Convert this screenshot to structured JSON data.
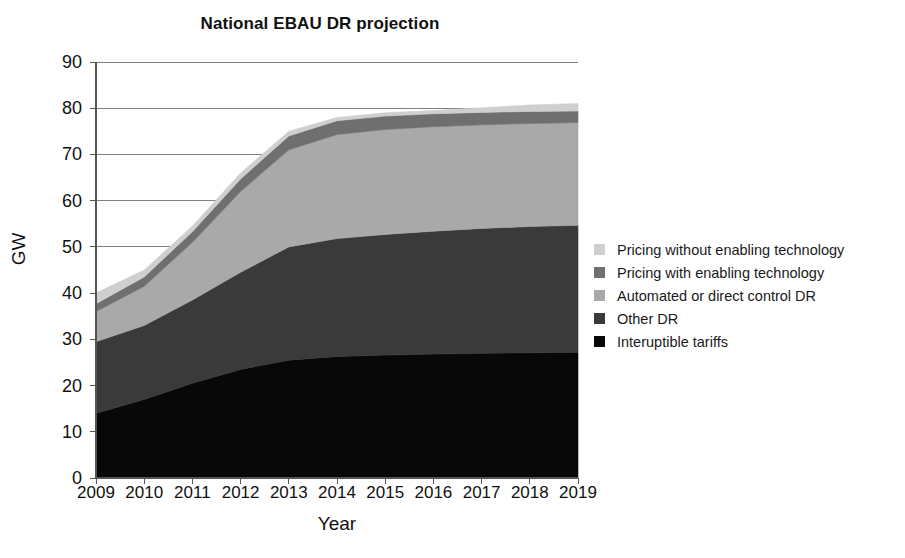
{
  "chart_data": {
    "type": "area",
    "title": "National EBAU DR projection",
    "xlabel": "Year",
    "ylabel": "GW",
    "stacked": true,
    "grid": true,
    "legend_position": "right",
    "categories": [
      2009,
      2010,
      2011,
      2012,
      2013,
      2014,
      2015,
      2016,
      2017,
      2018,
      2019
    ],
    "xtick_labels": [
      "2009",
      "2010",
      "2011",
      "2012",
      "2013",
      "2014",
      "2015",
      "2016",
      "2017",
      "2018",
      "2019"
    ],
    "ytick_labels": [
      "0",
      "10",
      "20",
      "30",
      "40",
      "50",
      "60",
      "70",
      "80",
      "90"
    ],
    "ytick_values": [
      0,
      10,
      20,
      30,
      40,
      50,
      60,
      70,
      80,
      90
    ],
    "ylim": [
      0,
      90
    ],
    "xlim": [
      2009,
      2019
    ],
    "series": [
      {
        "name": "Interuptible tariffs",
        "color": "#080808",
        "values": [
          14.0,
          17.0,
          20.5,
          23.5,
          25.5,
          26.3,
          26.6,
          26.8,
          27.0,
          27.1,
          27.2
        ]
      },
      {
        "name": "Other DR",
        "color": "#3a3a3a",
        "values": [
          15.5,
          16.0,
          18.0,
          21.0,
          24.5,
          25.5,
          26.1,
          26.6,
          27.0,
          27.3,
          27.5
        ]
      },
      {
        "name": "Automated or direct control DR",
        "color": "#a9a9a9",
        "values": [
          6.5,
          8.5,
          12.5,
          17.5,
          21.0,
          22.5,
          22.7,
          22.6,
          22.4,
          22.3,
          22.2
        ]
      },
      {
        "name": "Pricing with enabling technology",
        "color": "#6f6f6f",
        "values": [
          1.7,
          2.0,
          2.3,
          2.7,
          3.0,
          3.0,
          2.9,
          2.8,
          2.7,
          2.6,
          2.5
        ]
      },
      {
        "name": "Pricing without enabling technology",
        "color": "#cfcfcf",
        "values": [
          2.3,
          1.5,
          1.2,
          1.3,
          1.0,
          0.7,
          0.7,
          0.7,
          1.0,
          1.4,
          1.6
        ]
      }
    ],
    "legend_entries": [
      {
        "label": "Pricing without enabling technology",
        "color": "#cfcfcf"
      },
      {
        "label": "Pricing with enabling technology",
        "color": "#6f6f6f"
      },
      {
        "label": "Automated or direct control DR",
        "color": "#a9a9a9"
      },
      {
        "label": "Other DR",
        "color": "#3a3a3a"
      },
      {
        "label": "Interuptible tariffs",
        "color": "#080808"
      }
    ],
    "totals": [
      40.0,
      45.0,
      54.5,
      66.0,
      75.0,
      78.0,
      79.0,
      79.5,
      80.1,
      80.7,
      81.0
    ]
  },
  "style": {
    "axis_color": "#555555",
    "grid_color": "#808080",
    "background": "#ffffff",
    "text_color": "#111111"
  }
}
